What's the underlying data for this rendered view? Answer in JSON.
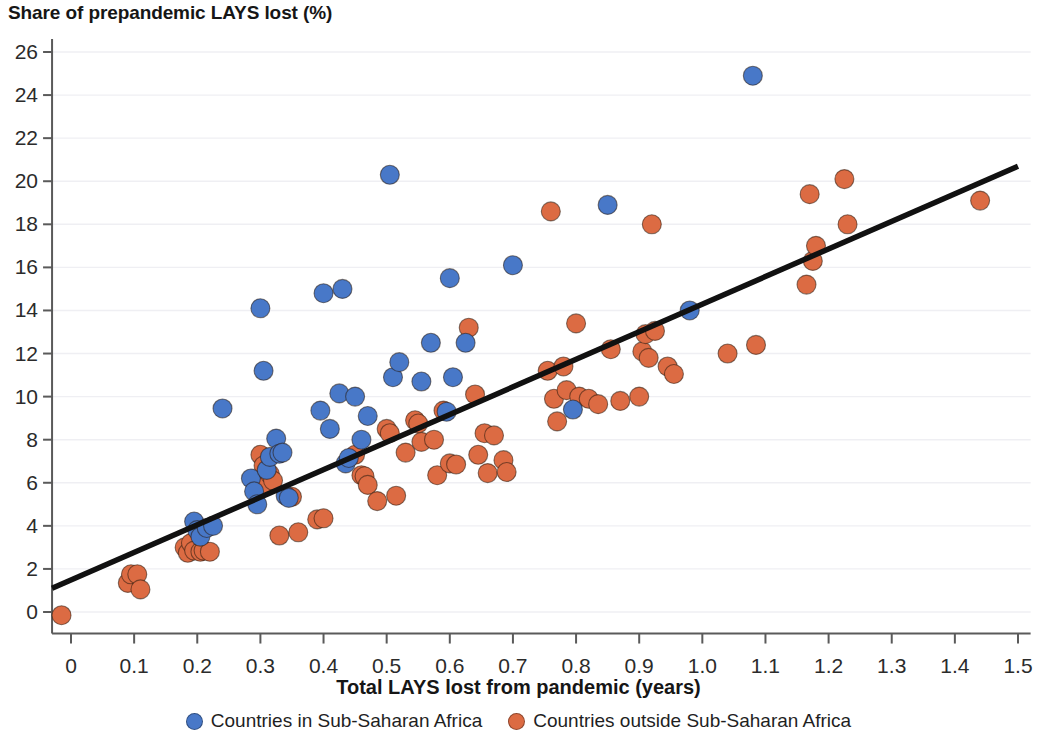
{
  "chart_data": {
    "type": "scatter",
    "title": "Share of prepandemic LAYS lost (%)",
    "xlabel": "Total LAYS lost from pandemic (years)",
    "ylabel": "Share of prepandemic LAYS lost (%)",
    "xlim": [
      -0.03,
      1.52
    ],
    "ylim": [
      -1.0,
      26.6
    ],
    "xticks": [
      0,
      0.1,
      0.2,
      0.3,
      0.4,
      0.5,
      0.6,
      0.7,
      0.8,
      0.9,
      1.0,
      1.1,
      1.2,
      1.3,
      1.4,
      1.5
    ],
    "xticklabels": [
      "0",
      "0.1",
      "0.2",
      "0.3",
      "0.4",
      "0.5",
      "0.6",
      "0.7",
      "0.8",
      "0.9",
      "1.0",
      "1.1",
      "1.2",
      "1.3",
      "1.4",
      "1.5"
    ],
    "yticks": [
      0,
      2,
      4,
      6,
      8,
      10,
      12,
      14,
      16,
      18,
      20,
      22,
      24,
      26
    ],
    "yticklabels": [
      "0",
      "2",
      "4",
      "6",
      "8",
      "10",
      "12",
      "14",
      "16",
      "18",
      "20",
      "22",
      "24",
      "26"
    ],
    "grid": true,
    "legend_position": "bottom",
    "colors": {
      "blue": "#4878C8",
      "orange": "#DC6B43",
      "trendline": "#111111",
      "grid": "#EFEFF3",
      "axis": "#5A5A5A"
    },
    "trendline": {
      "label": "linear fit",
      "x": [
        -0.03,
        1.5
      ],
      "y": [
        1.1,
        20.7
      ]
    },
    "series": [
      {
        "name": "Countries in Sub-Saharan Africa",
        "color": "#4878C8",
        "points": [
          [
            0.195,
            4.2
          ],
          [
            0.2,
            3.8
          ],
          [
            0.205,
            3.5
          ],
          [
            0.215,
            3.9
          ],
          [
            0.225,
            4.0
          ],
          [
            0.24,
            9.45
          ],
          [
            0.285,
            6.2
          ],
          [
            0.29,
            5.6
          ],
          [
            0.295,
            5.0
          ],
          [
            0.3,
            14.1
          ],
          [
            0.305,
            11.2
          ],
          [
            0.31,
            6.6
          ],
          [
            0.315,
            7.2
          ],
          [
            0.325,
            8.05
          ],
          [
            0.33,
            7.35
          ],
          [
            0.335,
            7.4
          ],
          [
            0.34,
            5.4
          ],
          [
            0.345,
            5.3
          ],
          [
            0.395,
            9.35
          ],
          [
            0.4,
            14.8
          ],
          [
            0.41,
            8.5
          ],
          [
            0.425,
            10.15
          ],
          [
            0.43,
            15.0
          ],
          [
            0.435,
            6.9
          ],
          [
            0.44,
            7.15
          ],
          [
            0.45,
            10.0
          ],
          [
            0.46,
            8.0
          ],
          [
            0.47,
            9.1
          ],
          [
            0.505,
            20.3
          ],
          [
            0.51,
            10.9
          ],
          [
            0.52,
            11.6
          ],
          [
            0.555,
            10.7
          ],
          [
            0.57,
            12.5
          ],
          [
            0.595,
            9.3
          ],
          [
            0.6,
            15.5
          ],
          [
            0.605,
            10.9
          ],
          [
            0.625,
            12.5
          ],
          [
            0.7,
            16.1
          ],
          [
            0.795,
            9.4
          ],
          [
            0.85,
            18.9
          ],
          [
            0.98,
            14.0
          ],
          [
            1.08,
            24.9
          ]
        ]
      },
      {
        "name": "Countries outside Sub-Saharan Africa",
        "color": "#DC6B43",
        "points": [
          [
            -0.015,
            -0.15
          ],
          [
            0.09,
            1.35
          ],
          [
            0.095,
            1.75
          ],
          [
            0.105,
            1.75
          ],
          [
            0.11,
            1.05
          ],
          [
            0.18,
            3.0
          ],
          [
            0.185,
            2.75
          ],
          [
            0.19,
            3.2
          ],
          [
            0.195,
            2.85
          ],
          [
            0.205,
            2.8
          ],
          [
            0.21,
            2.85
          ],
          [
            0.22,
            2.8
          ],
          [
            0.3,
            7.3
          ],
          [
            0.305,
            6.8
          ],
          [
            0.31,
            5.9
          ],
          [
            0.315,
            6.4
          ],
          [
            0.32,
            6.1
          ],
          [
            0.33,
            3.55
          ],
          [
            0.35,
            5.35
          ],
          [
            0.36,
            3.7
          ],
          [
            0.39,
            4.3
          ],
          [
            0.4,
            4.35
          ],
          [
            0.45,
            7.3
          ],
          [
            0.46,
            6.35
          ],
          [
            0.465,
            6.3
          ],
          [
            0.47,
            5.9
          ],
          [
            0.485,
            5.15
          ],
          [
            0.5,
            8.5
          ],
          [
            0.505,
            8.3
          ],
          [
            0.515,
            5.4
          ],
          [
            0.53,
            7.4
          ],
          [
            0.545,
            8.9
          ],
          [
            0.55,
            8.75
          ],
          [
            0.555,
            7.9
          ],
          [
            0.575,
            8.0
          ],
          [
            0.58,
            6.35
          ],
          [
            0.59,
            9.35
          ],
          [
            0.6,
            6.9
          ],
          [
            0.61,
            6.85
          ],
          [
            0.63,
            13.2
          ],
          [
            0.64,
            10.1
          ],
          [
            0.645,
            7.3
          ],
          [
            0.655,
            8.3
          ],
          [
            0.66,
            6.45
          ],
          [
            0.67,
            8.2
          ],
          [
            0.685,
            7.05
          ],
          [
            0.69,
            6.5
          ],
          [
            0.755,
            11.2
          ],
          [
            0.76,
            18.6
          ],
          [
            0.765,
            9.9
          ],
          [
            0.77,
            8.85
          ],
          [
            0.78,
            11.4
          ],
          [
            0.785,
            10.3
          ],
          [
            0.8,
            13.4
          ],
          [
            0.805,
            10.0
          ],
          [
            0.82,
            9.9
          ],
          [
            0.835,
            9.65
          ],
          [
            0.855,
            12.2
          ],
          [
            0.87,
            9.8
          ],
          [
            0.9,
            10.0
          ],
          [
            0.905,
            12.1
          ],
          [
            0.91,
            12.9
          ],
          [
            0.915,
            11.8
          ],
          [
            0.92,
            18.0
          ],
          [
            0.925,
            13.05
          ],
          [
            0.945,
            11.4
          ],
          [
            0.955,
            11.05
          ],
          [
            1.04,
            12.0
          ],
          [
            1.085,
            12.4
          ],
          [
            1.165,
            15.2
          ],
          [
            1.17,
            19.4
          ],
          [
            1.175,
            16.3
          ],
          [
            1.18,
            17.0
          ],
          [
            1.225,
            20.1
          ],
          [
            1.23,
            18.0
          ],
          [
            1.44,
            19.1
          ]
        ]
      }
    ]
  },
  "legend": {
    "entries": [
      {
        "label": "Countries in Sub-Saharan Africa",
        "color": "#4878C8"
      },
      {
        "label": "Countries outside Sub-Saharan Africa",
        "color": "#DC6B43"
      }
    ]
  }
}
